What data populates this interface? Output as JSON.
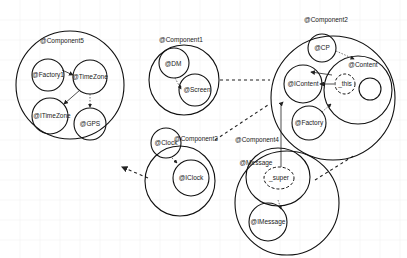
{
  "diagram": {
    "type": "component-dependency-diagram",
    "components": [
      {
        "id": "c5",
        "label": "@Component5",
        "children": [
          "@Factory1",
          "@TimeZone",
          "@ITimeZone",
          "@GPS"
        ]
      },
      {
        "id": "c1",
        "label": "@Component1",
        "children": [
          "@DM",
          "@Screen"
        ]
      },
      {
        "id": "c3",
        "label": "@Component3",
        "children": [
          "@Clock",
          "@IClock"
        ]
      },
      {
        "id": "c2",
        "label": "@Component2",
        "children": [
          "@CP",
          "@Content",
          "@IContent",
          "@Factory",
          "_this"
        ]
      },
      {
        "id": "c4",
        "label": "@Component4",
        "children": [
          "@Message",
          "_super",
          "@IMessage"
        ]
      }
    ],
    "nodes": {
      "factory1": "@Factory1",
      "timezone": "@TimeZone",
      "itimezone": "@ITimeZone",
      "gps": "@GPS",
      "dm": "@DM",
      "screen": "@Screen",
      "clock": "@Clock",
      "iclock": "@IClock",
      "cp": "@CP",
      "content": "@Content",
      "this": "_this",
      "icontent": "@IContent",
      "factory": "@Factory",
      "message": "@Message",
      "super": "_super",
      "imessage": "@IMessage"
    },
    "edges": [
      {
        "from": "@Factory1",
        "to": "@TimeZone",
        "style": "solid"
      },
      {
        "from": "@TimeZone",
        "to": "@ITimeZone",
        "style": "solid"
      },
      {
        "from": "@TimeZone",
        "to": "@GPS",
        "style": "dotted"
      },
      {
        "from": "@DM",
        "to": "@Screen",
        "style": "dotted"
      },
      {
        "from": "@Clock",
        "to": "@IClock",
        "style": "dotted"
      },
      {
        "from": "@CP",
        "to": "@Content",
        "style": "dotted"
      },
      {
        "from": "@Content",
        "to": "@IContent",
        "style": "solid"
      },
      {
        "from": "_this",
        "to": "@IContent",
        "style": "solid"
      },
      {
        "from": "@Factory",
        "to": "@Content",
        "style": "dotted"
      },
      {
        "from": "_super",
        "to": "@IContent",
        "style": "solid"
      },
      {
        "from": "@Message",
        "to": "@IMessage",
        "style": "dotted"
      },
      {
        "from": "@Component3",
        "to": "@Component5",
        "style": "dashed"
      },
      {
        "from": "@Component1",
        "to": "@Component2",
        "style": "dashed"
      },
      {
        "from": "@Component3",
        "to": "@Component2",
        "style": "dashed"
      },
      {
        "from": "@Component4",
        "to": "@Component2",
        "style": "dashed"
      }
    ]
  }
}
